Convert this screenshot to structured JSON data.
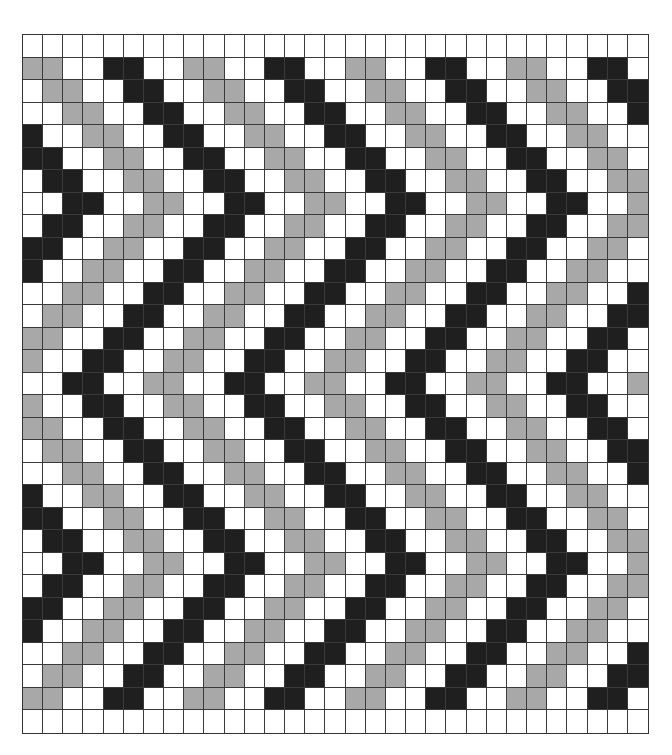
{
  "pattern": {
    "rows": 31,
    "cols": 31,
    "legend": {
      "B": "dark",
      "G": "gray",
      "W": "white"
    },
    "colors": {
      "B": "#1f1f1f",
      "G": "#a8a8a8",
      "W": "#ffffff",
      "line": "#3a3a3a"
    },
    "grid": [
      "WWWWWWWWWWWWWWWWWWWWWWWWWWWWWWW",
      "GGWWBBWWGGWWBBWWGGWWBBWWGGWWBBW",
      "WGGWWBBWWGGWWBBWWGGWWBBWWGGWWBB",
      "WWGGWWBBWWGGWWBBWWGGWWBBWWGGWWB",
      "BWWGGWWBBWWGGWWBBWWGGWWBBWWGGWW",
      "BBWWGGWWBBWWGGWWBBWWGGWWBBWWGGW",
      "WBBWWGGWWBBWWGGWWBBWWGGWWBBWWGG",
      "WWBBWWGGWWBBWWGGWWBBWWGGWWBBWWG",
      "WBBWWGGWWBBWWGGWWBBWWGGWWBBWWGG",
      "BBWWGGWWBBWWGGWWBBWWGGWWBBWWGGW",
      "BWWGGWWBBWWGGWWBBWWGGWWBBWWGGWW",
      "WWGGWWBBWWGGWWBBWWGGWWBBWWGGWWB",
      "WGGWWBBWWGGWWBBWWGGWWBBWWGGWWBB",
      "GGWWBBWWGGWWBBWWGGWWBBWWGGWWBBW",
      "GWWBBWWGGWWBBWWGGWWBBWWGGWWBBWW",
      "WWBBWWGGWWBBWWGGWWBBWWGGWWBBWWG",
      "GWWBBWWGGWWBBWWGGWWBBWWGGWWBBWW",
      "GGWWBBWWGGWWBBWWGGWWBBWWGGWWBBW",
      "WGGWWBBWWGGWWBBWWGGWWBBWWGGWWBB",
      "WWGGWWBBWWGGWWBBWWGGWWBBWWGGWWB",
      "BWWGGWWBBWWGGWWBBWWGGWWBBWWGGWW",
      "BBWWGGWWBBWWGGWWBBWWGGWWBBWWGGW",
      "WBBWWGGWWBBWWGGWWBBWWGGWWBBWWGG",
      "WWBBWWGGWWBBWWGGWWBBWWGGWWBBWWG",
      "WBBWWGGWWBBWWGGWWBBWWGGWWBBWWGG",
      "BBWWGGWWBBWWGGWWBBWWGGWWBBWWGGW",
      "BWWGGWWBBWWGGWWBBWWGGWWBBWWGGWW",
      "WWGGWWBBWWGGWWBBWWGGWWBBWWGGWWB",
      "WGGWWBBWWGGWWBBWWGGWWBBWWGGWWBB",
      "GGWWBBWWGGWWBBWWGGWWBBWWGGWWBBW",
      "WWWWWWWWWWWWWWWWWWWWWWWWWWWWWWW"
    ]
  }
}
